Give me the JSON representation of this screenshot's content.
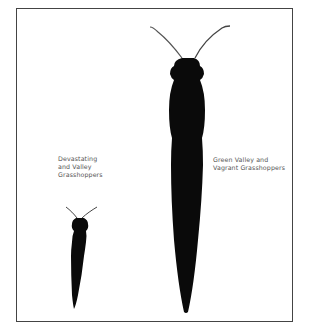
{
  "figure": {
    "type": "size-comparison-silhouettes",
    "colors": {
      "silhouette": "#0a0a0a",
      "frame": "#444444",
      "text": "#555555",
      "background": "#ffffff"
    }
  },
  "labels": {
    "small": {
      "lines": [
        "Devastating",
        "and Valley",
        "Grasshoppers"
      ]
    },
    "large": {
      "lines": [
        "Green Valley and",
        "Vagrant Grasshoppers"
      ]
    }
  },
  "silhouettes": [
    {
      "id": "small-grasshopper",
      "label_ref": "small"
    },
    {
      "id": "large-grasshopper",
      "label_ref": "large"
    }
  ]
}
